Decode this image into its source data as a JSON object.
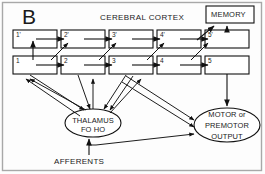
{
  "figure": {
    "panel_letter": "B",
    "title": "CEREBRAL CORTEX",
    "frame_color": "#a8a8a8",
    "background_color": "#fdfdfd",
    "stroke_color": "#1a1a1a"
  },
  "memory_box": {
    "label": "MEMORY"
  },
  "cortex_rows": {
    "upper_row": [
      {
        "label": "1'"
      },
      {
        "label": "2'"
      },
      {
        "label": "3'"
      },
      {
        "label": "4'"
      },
      {
        "label": "5'"
      }
    ],
    "lower_row": [
      {
        "label": "1"
      },
      {
        "label": "2"
      },
      {
        "label": "3"
      },
      {
        "label": "4"
      },
      {
        "label": "5"
      }
    ]
  },
  "nodes": {
    "thalamus": {
      "line1": "THALAMUS",
      "line2": "FO  HO"
    },
    "motor": {
      "line1": "MOTOR or",
      "line2": "PREMOTOR",
      "line3": "OUTPUT"
    }
  },
  "afferents": {
    "label": "AFFERENTS"
  }
}
